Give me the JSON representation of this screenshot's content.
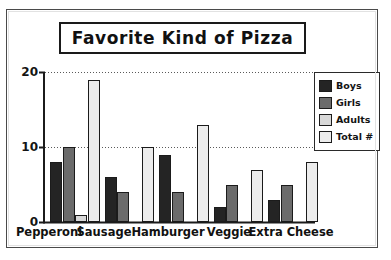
{
  "chart_data": {
    "type": "bar",
    "title": "Favorite Kind of Pizza",
    "xlabel": "",
    "ylabel": "",
    "ylim": [
      0,
      20
    ],
    "yticks": [
      0,
      10,
      20
    ],
    "ytick_labels": [
      "0",
      "10",
      "20"
    ],
    "grid": true,
    "grid_style": "dotted-horizontal",
    "legend_position": "right",
    "categories": [
      "Pepperoni",
      "Sausage",
      "Hamburger",
      "Veggie",
      "Extra Cheese"
    ],
    "series": [
      {
        "name": "Boys",
        "color": "#242424",
        "pattern": "solid",
        "values": [
          8,
          6,
          9,
          2,
          3
        ]
      },
      {
        "name": "Girls",
        "color": "#6b6b6b",
        "pattern": "dark-checker",
        "values": [
          10,
          4,
          4,
          5,
          5
        ]
      },
      {
        "name": "Adults",
        "color": "#d8d8d8",
        "pattern": "medium-dots",
        "values": [
          1,
          0,
          0,
          0,
          0
        ]
      },
      {
        "name": "Total #",
        "color": "#ececec",
        "pattern": "light-dots",
        "values": [
          19,
          10,
          13,
          7,
          8
        ]
      }
    ]
  },
  "legend": {
    "items": [
      {
        "label": "Boys"
      },
      {
        "label": "Girls"
      },
      {
        "label": "Adults"
      },
      {
        "label": "Total #"
      }
    ]
  },
  "colors": {
    "axis": "#1b1b1b",
    "grid": "#5a5a5a",
    "frame": "#4a4a4a",
    "text": "#111111"
  }
}
